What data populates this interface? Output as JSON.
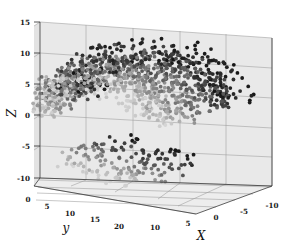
{
  "figure": {
    "background_color": "#ffffff",
    "pane_color": "#e9e9e9",
    "grid_color": "#9a9a9a",
    "axis_color": "#3a3a3a"
  },
  "chart_data": {
    "type": "scatter",
    "projection": "3d",
    "title": "",
    "xlabel": "X",
    "ylabel": "y",
    "zlabel": "Z",
    "xticks": [
      10,
      5,
      0,
      -5,
      -10
    ],
    "yticks": [
      0,
      5,
      10,
      15,
      20
    ],
    "zticks": [
      15,
      10,
      5,
      0,
      -5,
      -10
    ],
    "xlim": [
      12,
      -12
    ],
    "ylim": [
      0,
      22
    ],
    "zlim": [
      -12,
      16
    ],
    "grid": true,
    "legend": null,
    "colormap": "grayscale-depth",
    "marker": "circle",
    "marker_size": 4,
    "point_count": 1400,
    "series": [
      {
        "name": "near-cluster",
        "color": "#1b1b1b",
        "description": "dense dark points upper-left and central wedge",
        "x": [
          9.8,
          8.4,
          7.1,
          6.2,
          5.0,
          4.1,
          3.2,
          2.4,
          1.5,
          0.6,
          -0.4,
          -1.2,
          9.1,
          7.8,
          6.5,
          5.4,
          4.4,
          3.5,
          2.6,
          1.7,
          0.9,
          0.1
        ],
        "y": [
          2.1,
          3.4,
          4.6,
          5.5,
          6.4,
          7.2,
          8.1,
          8.8,
          9.6,
          10.4,
          11.1,
          11.8,
          2.8,
          4.0,
          5.1,
          6.0,
          6.9,
          7.7,
          8.5,
          9.2,
          10.0,
          10.7
        ],
        "z": [
          13.5,
          12.8,
          11.9,
          10.6,
          9.2,
          7.6,
          6.0,
          4.2,
          2.4,
          0.5,
          -1.5,
          -3.4,
          11.2,
          10.1,
          8.8,
          7.4,
          5.9,
          4.3,
          2.6,
          0.8,
          -1.0,
          -2.9
        ]
      },
      {
        "name": "mid-cluster",
        "color": "#6e6e6e",
        "description": "medium gray points forming left and lower rim",
        "x": [
          11.0,
          10.2,
          9.4,
          8.6,
          7.7,
          6.9,
          6.0,
          5.1,
          4.3,
          3.4
        ],
        "y": [
          1.0,
          1.9,
          2.9,
          3.9,
          4.9,
          5.9,
          6.9,
          7.9,
          8.9,
          9.9
        ],
        "z": [
          8.0,
          6.2,
          4.4,
          2.5,
          0.7,
          -1.2,
          -3.0,
          -4.8,
          -6.5,
          -8.1
        ]
      },
      {
        "name": "far-cluster",
        "color": "#c6c6c6",
        "description": "light gray faded points at far right of the volume",
        "x": [
          -2.0,
          -3.1,
          -4.2,
          -5.3,
          -6.4,
          -7.5,
          -8.5,
          -9.4,
          -10.2,
          -10.9
        ],
        "y": [
          12.5,
          13.2,
          14.0,
          14.8,
          15.6,
          16.4,
          17.2,
          18.0,
          18.8,
          19.6
        ],
        "z": [
          9.0,
          7.0,
          5.0,
          3.0,
          1.0,
          -1.0,
          -3.0,
          -5.0,
          -7.0,
          -9.0
        ]
      }
    ]
  }
}
